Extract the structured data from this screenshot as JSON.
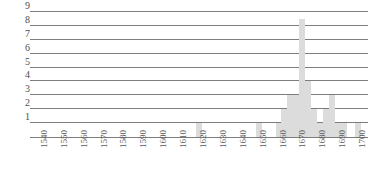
{
  "chart_data": {
    "type": "bar",
    "title": "",
    "subtitle": "",
    "xlabel": "",
    "ylabel": "",
    "grid": true,
    "legend": null,
    "xlim": [
      1535,
      1705
    ],
    "ylim": [
      0,
      9
    ],
    "y_ticks": [
      1,
      2,
      3,
      4,
      5,
      6,
      7,
      8,
      9
    ],
    "x_ticks": [
      1540,
      1550,
      1560,
      1570,
      1580,
      1590,
      1600,
      1610,
      1620,
      1630,
      1640,
      1650,
      1660,
      1670,
      1680,
      1690,
      1700
    ],
    "bar_color": "#dcdcdc",
    "grid_color": "#7d7d7d",
    "categories": [
      1540,
      1545,
      1550,
      1555,
      1560,
      1565,
      1570,
      1575,
      1580,
      1585,
      1590,
      1595,
      1600,
      1605,
      1610,
      1615,
      1620,
      1625,
      1630,
      1635,
      1640,
      1645,
      1650,
      1655,
      1660,
      1663,
      1666,
      1669,
      1672,
      1675,
      1678,
      1681,
      1684,
      1687,
      1690,
      1693,
      1696,
      1700
    ],
    "values": [
      0,
      0,
      0,
      0,
      0,
      0,
      0,
      0,
      0,
      0,
      0,
      0,
      0,
      0,
      0,
      0,
      1,
      0,
      0,
      0,
      0,
      0,
      1,
      0,
      1,
      2,
      3,
      3,
      8.5,
      4,
      2,
      1,
      2,
      3,
      1,
      1,
      0,
      1
    ]
  },
  "y_axis": {
    "labels": [
      "9",
      "8",
      "7",
      "6",
      "5",
      "4",
      "3",
      "2",
      "1"
    ]
  },
  "x_axis": {
    "labels": [
      "1540",
      "1550",
      "1560",
      "1570",
      "1580",
      "1590",
      "1600",
      "1610",
      "1620",
      "1630",
      "1640",
      "1650",
      "1660",
      "1670",
      "1680",
      "1690",
      "1700"
    ]
  }
}
